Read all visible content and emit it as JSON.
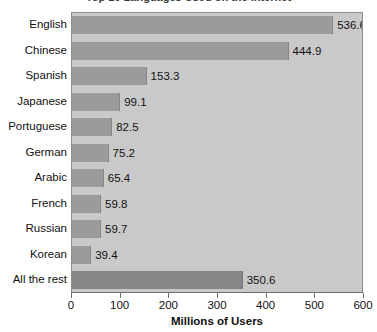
{
  "chart_data": {
    "type": "bar",
    "orientation": "horizontal",
    "title": "Top 10 Languages Used on the Internet",
    "categories": [
      "English",
      "Chinese",
      "Spanish",
      "Japanese",
      "Portuguese",
      "German",
      "Arabic",
      "French",
      "Russian",
      "Korean",
      "All the rest"
    ],
    "values": [
      536.6,
      444.9,
      153.3,
      99.1,
      82.5,
      75.2,
      65.4,
      59.8,
      59.7,
      39.4,
      350.6
    ],
    "value_labels": [
      "536.6",
      "444.9",
      "153.3",
      "99.1",
      "82.5",
      "75.2",
      "65.4",
      "59.8",
      "59.7",
      "39.4",
      "350.6"
    ],
    "xlabel": "Millions of Users",
    "ylabel": "",
    "xlim": [
      0,
      600
    ],
    "xticks": [
      0,
      100,
      200,
      300,
      400,
      500,
      600
    ],
    "xtick_labels": [
      "0",
      "100",
      "200",
      "300",
      "400",
      "500",
      "600"
    ],
    "grid": false,
    "legend": null,
    "colors": {
      "bar": "#9b9b9b",
      "bar_rest": "#868686",
      "plot_background": "#c9c9c9",
      "figure_background": "#ffffff",
      "axis": "#6d6d6d",
      "text": "#111111"
    }
  }
}
